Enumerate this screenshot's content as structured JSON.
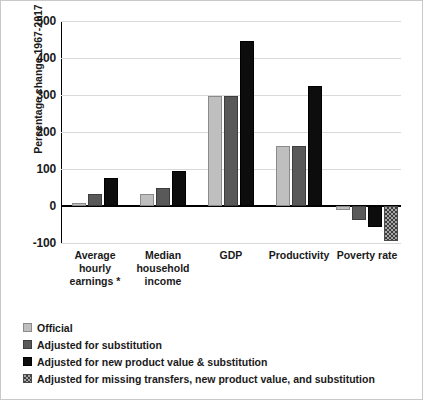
{
  "chart_data": {
    "type": "bar",
    "title": "",
    "xlabel": "",
    "ylabel": "Percentage change 1967-2017",
    "ylim": [
      -100,
      500
    ],
    "ytick_labels": [
      "500",
      "400",
      "300",
      "200",
      "100",
      "0",
      "-100"
    ],
    "ytick_values": [
      500,
      400,
      300,
      200,
      100,
      0,
      -100
    ],
    "grid": true,
    "legend_position": "below-bottom-left",
    "categories": [
      "Average hourly earnings *",
      "Median household income",
      "GDP",
      "Productivity",
      "Poverty rate"
    ],
    "category_lines": [
      [
        "Average",
        "hourly",
        "earnings *"
      ],
      [
        "Median",
        "household",
        "income"
      ],
      [
        "GDP"
      ],
      [
        "Productivity"
      ],
      [
        "Poverty rate"
      ]
    ],
    "series": [
      {
        "name": "Official",
        "color": "#bfbfbf",
        "values": [
          8,
          33,
          297,
          163,
          -10
        ]
      },
      {
        "name": "Adjusted for substitution",
        "color": "#595959",
        "values": [
          33,
          48,
          297,
          163,
          -38
        ]
      },
      {
        "name": "Adjusted for new product value & substitution",
        "color": "#0d0d0d",
        "values": [
          75,
          94,
          447,
          325,
          -57
        ]
      },
      {
        "name": "Adjusted for missing transfers, new product value, and substitution",
        "color": "#a6a6a6-hatched",
        "values": [
          null,
          null,
          null,
          null,
          -95
        ]
      }
    ]
  },
  "legend": {
    "items": [
      {
        "label": "Official",
        "style": "light-gray"
      },
      {
        "label": "Adjusted for substitution",
        "style": "dark-gray"
      },
      {
        "label": "Adjusted for new product value & substitution",
        "style": "black"
      },
      {
        "label": "Adjusted for missing transfers, new product value, and substitution",
        "style": "hatched"
      }
    ]
  },
  "axis": {
    "y_title": "Percentage change 1967-2017",
    "ticks": [
      "500",
      "400",
      "300",
      "200",
      "100",
      "0",
      "-100"
    ]
  },
  "colors": {
    "official": "#bfbfbf",
    "substitution": "#595959",
    "new_product": "#0d0d0d",
    "transfers": "#a6a6a6",
    "gridline": "#d9d9d9",
    "axis": "#000000",
    "text": "#1a1a1a",
    "frame": "#c9c9c9"
  }
}
